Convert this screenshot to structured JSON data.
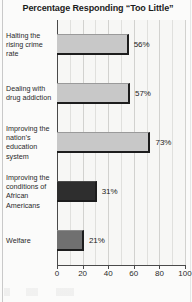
{
  "chart_data": {
    "type": "bar",
    "orientation": "horizontal",
    "title": "Percentage Responding “Too Little”",
    "xlabel": "",
    "ylabel": "",
    "xlim": [
      0,
      100
    ],
    "xticks": [
      "0",
      "20",
      "40",
      "60",
      "80",
      "100"
    ],
    "xtick_values": [
      0,
      20,
      40,
      60,
      80,
      100
    ],
    "grid": true,
    "grid_minor_step": 10,
    "legend": false,
    "categories": [
      "Halting the rising crime rate",
      "Dealing with drug addiction",
      "Improving the nation’s education system",
      "Improving the conditions of African Americans",
      "Welfare"
    ],
    "values": [
      56,
      57,
      73,
      31,
      21
    ],
    "value_labels": [
      "56%",
      "57%",
      "73%",
      "31%",
      "21%"
    ],
    "bar_colors": [
      "#c8c8c8",
      "#c8c8c8",
      "#c8c8c8",
      "#2e2e2e",
      "#707070"
    ]
  },
  "colors": {
    "background": "#fbfbfa",
    "plot_background": "#f7f7f5",
    "axis": "#4a4a4a",
    "gridline": "#e0e0dd",
    "bar_light": "#c8c8c8",
    "bar_mid": "#707070",
    "bar_dark": "#2e2e2e",
    "bar_shadow": "#1d1d1d",
    "text": "#2a2a2a",
    "title_text": "#1b1b1b"
  }
}
